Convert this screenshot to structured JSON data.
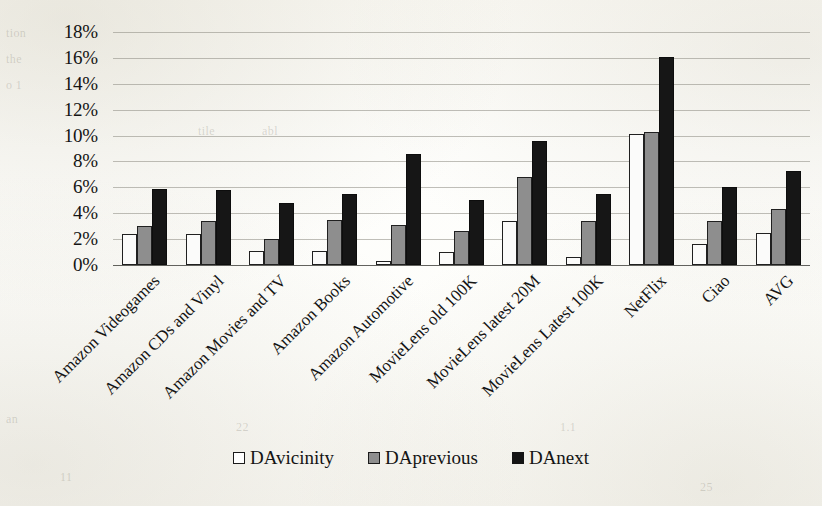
{
  "chart_data": {
    "type": "bar",
    "title": "",
    "xlabel": "",
    "ylabel": "",
    "ylim": [
      0,
      18
    ],
    "y_tick_labels": [
      "18%",
      "16%",
      "14%",
      "12%",
      "10%",
      "8%",
      "6%",
      "4%",
      "2%",
      "0%"
    ],
    "y_tick_values": [
      18,
      16,
      14,
      12,
      10,
      8,
      6,
      4,
      2,
      0
    ],
    "y_unit": "%",
    "grid": true,
    "legend_position": "bottom",
    "categories": [
      "Amazon Videogames",
      "Amazon CDs and Vinyl",
      "Amazon Movies and TV",
      "Amazon Books",
      "Amazon Automotive",
      "MovieLens old 100K",
      "MovieLens latest 20M",
      "MovieLens Latest 100K",
      "NetFlix",
      "Ciao",
      "AVG"
    ],
    "series": [
      {
        "name": "DAvicinity",
        "color": "#ffffff",
        "values": [
          2.4,
          2.4,
          1.1,
          1.1,
          0.3,
          1.0,
          3.4,
          0.6,
          10.1,
          1.6,
          2.5
        ]
      },
      {
        "name": "DAprevious",
        "color": "#8e8e8e",
        "values": [
          3.0,
          3.4,
          2.0,
          3.5,
          3.1,
          2.6,
          6.8,
          3.4,
          10.3,
          3.4,
          4.3
        ]
      },
      {
        "name": "DAnext",
        "color": "#141414",
        "values": [
          5.9,
          5.8,
          4.8,
          5.5,
          8.6,
          5.0,
          9.6,
          5.5,
          16.1,
          6.0,
          7.3
        ]
      }
    ]
  },
  "legend": {
    "items": [
      {
        "label": "DAvicinity",
        "swatch": "legend-swatch-vicinity"
      },
      {
        "label": "DAprevious",
        "swatch": "legend-swatch-previous"
      },
      {
        "label": "DAnext",
        "swatch": "legend-swatch-next"
      }
    ]
  },
  "scan_artifacts": {
    "ghost_text": [
      "tion",
      "the",
      "o 1",
      "tile",
      "abl",
      "an",
      "22",
      "1.1",
      "11",
      "25"
    ]
  }
}
